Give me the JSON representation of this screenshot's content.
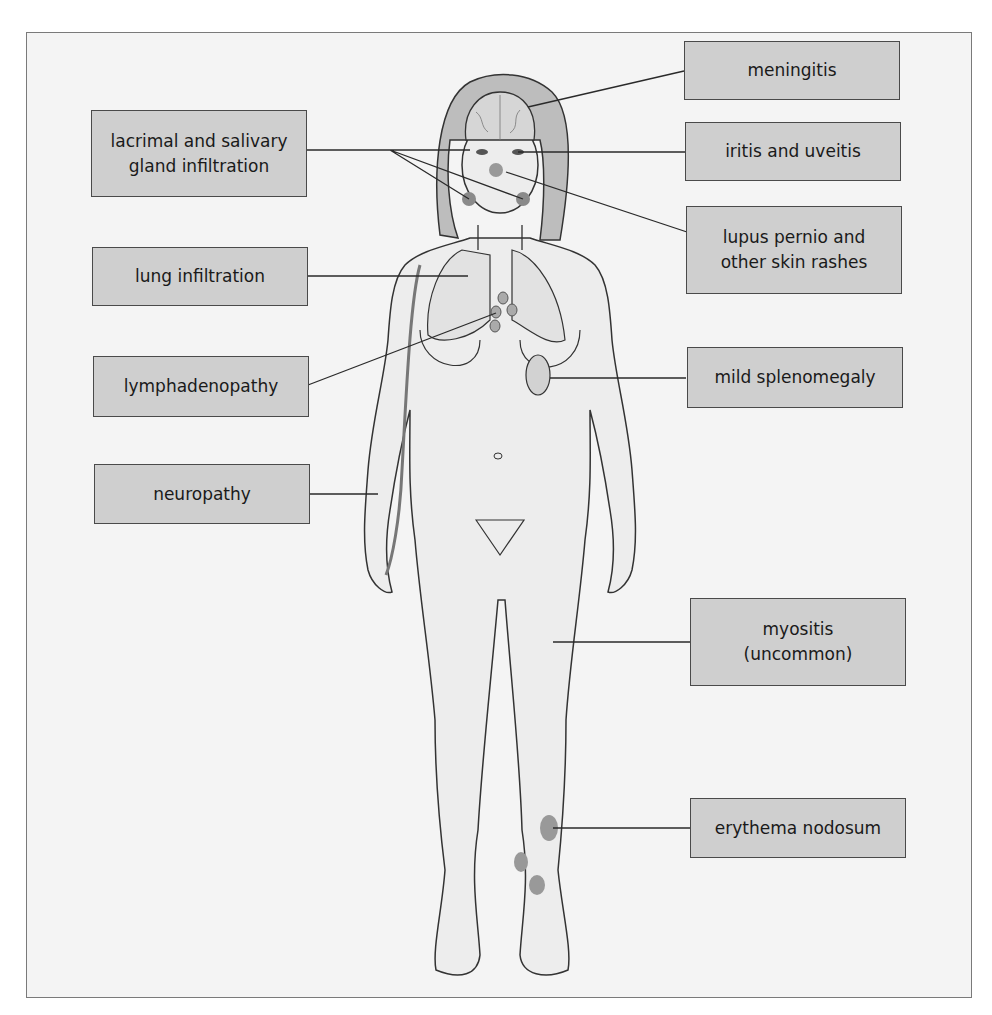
{
  "figure": {
    "colors": {
      "frame_bg": "#f4f4f4",
      "label_bg": "#cfcfcf",
      "label_border": "#4a4a4a",
      "line": "#2a2a2a",
      "body_fill": "#ededed",
      "hair_fill": "#bdbdbd",
      "lesion": "#8f8f8f"
    },
    "labels": {
      "lacrimal": "lacrimal and salivary\ngland infiltration",
      "lung": "lung infiltration",
      "lymph": "lymphadenopathy",
      "neuropathy": "neuropathy",
      "meningitis": "meningitis",
      "iritis": "iritis and uveitis",
      "lupus": "lupus pernio and\nother skin rashes",
      "spleen": "mild splenomegaly",
      "myositis": "myositis\n(uncommon)",
      "erythema": "erythema nodosum"
    }
  }
}
